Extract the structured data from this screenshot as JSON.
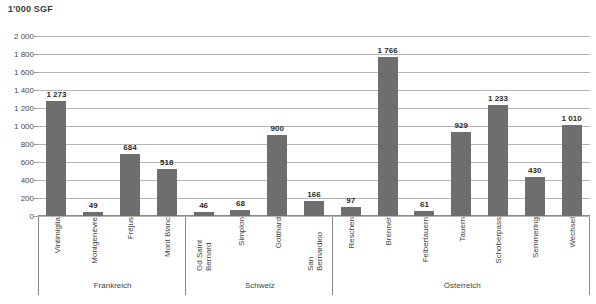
{
  "chart_data": {
    "type": "bar",
    "title": "1'000 SGF",
    "xlabel": "",
    "ylabel": "",
    "ylim": [
      0,
      2000
    ],
    "ytick_step": 200,
    "yticks": [
      "0",
      "200",
      "400",
      "600",
      "800",
      "1 000",
      "1 200",
      "1 400",
      "1 600",
      "1 800",
      "2 000"
    ],
    "grid": true,
    "legend": "none",
    "bar_color": "#6e6e6e",
    "categories": [
      "Vintimiglia",
      "Montgenèvre",
      "Fréjus",
      "Mont Blanc",
      "Gd Saint Bernard",
      "Simplon",
      "Gotthard",
      "San Bernardino",
      "Reschen",
      "Brenner",
      "Felbertauern",
      "Tauern",
      "Schoberpass",
      "Semmering",
      "Wechsel"
    ],
    "values": [
      1273,
      49,
      684,
      518,
      46,
      68,
      900,
      166,
      97,
      1766,
      61,
      929,
      1233,
      430,
      1010
    ],
    "value_labels": [
      "1 273",
      "49",
      "684",
      "518",
      "46",
      "68",
      "900",
      "166",
      "97",
      "1 766",
      "61",
      "929",
      "1 233",
      "430",
      "1 010"
    ],
    "groups": [
      {
        "label": "Frankreich",
        "start": 0,
        "count": 4
      },
      {
        "label": "Schweiz",
        "start": 4,
        "count": 4
      },
      {
        "label": "Österreich",
        "start": 8,
        "count": 7
      }
    ]
  }
}
